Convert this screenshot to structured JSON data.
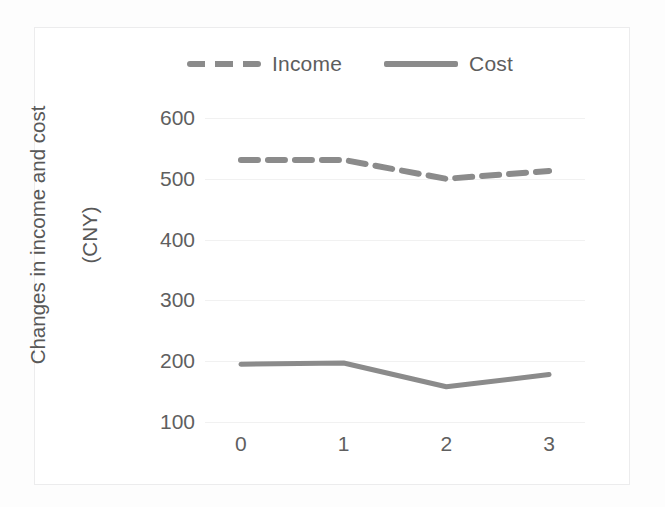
{
  "chart_data": {
    "type": "line",
    "title": "",
    "xlabel": "",
    "ylabel": "Changes in income and cost (CNY)",
    "ylabel_lines": [
      "Changes in income and cost",
      "(CNY)"
    ],
    "categories": [
      "0",
      "1",
      "2",
      "3"
    ],
    "x": [
      0,
      1,
      2,
      3
    ],
    "xlim": [
      -0.35,
      3.35
    ],
    "ylim": [
      100,
      600
    ],
    "ytick_labels": [
      "100",
      "200",
      "300",
      "400",
      "500",
      "600"
    ],
    "yticks": [
      100,
      200,
      300,
      400,
      500,
      600
    ],
    "grid": true,
    "grid_axis": "y",
    "legend_position": "top-center",
    "series": [
      {
        "name": "Income",
        "values": [
          531,
          531,
          500,
          513
        ],
        "style": "dashed",
        "color": "#8b8b8b",
        "linewidth": 6
      },
      {
        "name": "Cost",
        "values": [
          195,
          197,
          158,
          178
        ],
        "style": "solid",
        "color": "#8b8b8b",
        "linewidth": 5
      }
    ]
  },
  "legend": {
    "items": [
      {
        "label": "Income",
        "swatch": "dashed-line-swatch"
      },
      {
        "label": "Cost",
        "swatch": "solid-line-swatch"
      }
    ]
  },
  "colors": {
    "series_gray": "#8b8b8b",
    "gridline": "#f1f1f1",
    "tick_text": "#5f5f5f",
    "frame": "#ececed",
    "background": "#ffffff"
  }
}
